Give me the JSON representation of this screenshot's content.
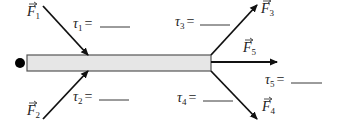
{
  "diagram": {
    "colors": {
      "ink": "#111111",
      "rod_fill": "#e6e6e6",
      "rod_stroke": "#555555",
      "pivot": "#000000",
      "text": "#222222"
    },
    "rod": {
      "x": 27,
      "y": 55,
      "width": 184,
      "height": 16
    },
    "pivot": {
      "cx": 20,
      "cy": 63,
      "r": 5
    },
    "forces": [
      {
        "id": "F1",
        "symbol": "F",
        "sub": "1",
        "x1": 43,
        "y1": 6,
        "x2": 88,
        "y2": 55,
        "label_x": 27,
        "label_y": 16
      },
      {
        "id": "F2",
        "symbol": "F",
        "sub": "2",
        "x1": 43,
        "y1": 119,
        "x2": 88,
        "y2": 71,
        "label_x": 27,
        "label_y": 115
      },
      {
        "id": "F3",
        "symbol": "F",
        "sub": "3",
        "x1": 211,
        "y1": 55,
        "x2": 257,
        "y2": 5,
        "label_x": 261,
        "label_y": 13
      },
      {
        "id": "F4",
        "symbol": "F",
        "sub": "4",
        "x1": 211,
        "y1": 71,
        "x2": 257,
        "y2": 119,
        "label_x": 262,
        "label_y": 111
      },
      {
        "id": "F5",
        "symbol": "F",
        "sub": "5",
        "x1": 211,
        "y1": 62,
        "x2": 277,
        "y2": 62,
        "label_x": 243,
        "label_y": 52
      }
    ],
    "torques": [
      {
        "id": "tau1",
        "symbol": "τ",
        "sub": "1",
        "eq": "=",
        "blank": "",
        "x": 73,
        "y": 28,
        "line_x1": 100,
        "line_x2": 130
      },
      {
        "id": "tau2",
        "symbol": "τ",
        "sub": "2",
        "eq": "=",
        "blank": "",
        "x": 73,
        "y": 101,
        "line_x1": 99,
        "line_x2": 129
      },
      {
        "id": "tau3",
        "symbol": "τ",
        "sub": "3",
        "eq": "=",
        "blank": "",
        "x": 175,
        "y": 26,
        "line_x1": 200,
        "line_x2": 230
      },
      {
        "id": "tau4",
        "symbol": "τ",
        "sub": "4",
        "eq": "=",
        "blank": "",
        "x": 177,
        "y": 102,
        "line_x1": 203,
        "line_x2": 233
      },
      {
        "id": "tau5",
        "symbol": "τ",
        "sub": "5",
        "eq": "=",
        "blank": "",
        "x": 265,
        "y": 84,
        "line_x1": 291,
        "line_x2": 322
      }
    ]
  }
}
